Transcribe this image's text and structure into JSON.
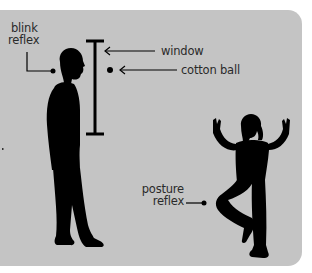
{
  "diagram": {
    "title": "",
    "background_color": "#c4c4c4",
    "silhouette_color": "#000000",
    "labels": {
      "blink_reflex": [
        "blink",
        "reflex"
      ],
      "window": "window",
      "cotton_ball": "cotton ball",
      "posture_reflex": [
        "posture",
        "reflex"
      ]
    },
    "figures": [
      {
        "name": "adult-man",
        "pose": "standing profile facing right"
      },
      {
        "name": "child",
        "pose": "standing on one leg, arms raised"
      }
    ],
    "elements": [
      {
        "name": "window",
        "type": "vertical I-bar"
      },
      {
        "name": "cotton-ball",
        "type": "dot"
      }
    ]
  }
}
